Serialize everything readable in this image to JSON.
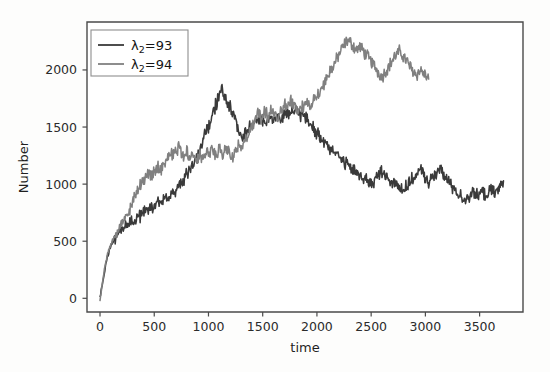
{
  "chart_data": {
    "type": "line",
    "title": "",
    "xlabel": "time",
    "ylabel": "Number",
    "xlim": [
      -120,
      3900
    ],
    "ylim": [
      -120,
      2420
    ],
    "xticks": [
      0,
      500,
      1000,
      1500,
      2000,
      2500,
      3000,
      3500
    ],
    "xtick_labels": [
      "0",
      "500",
      "1000",
      "1500",
      "2000",
      "2500",
      "3000",
      "3500"
    ],
    "yticks": [
      0,
      500,
      1000,
      1500,
      2000
    ],
    "ytick_labels": [
      "0",
      "500",
      "1000",
      "1500",
      "2000"
    ],
    "grid": false,
    "legend_position": "upper left",
    "series": [
      {
        "name": "lambda2_93",
        "legend_label": "λ₂=93",
        "legend_symbol": "λ",
        "legend_sub": "2",
        "legend_rest": "=93",
        "color": "#3a3a3a",
        "x": [
          0,
          20,
          40,
          60,
          80,
          100,
          120,
          140,
          160,
          180,
          200,
          230,
          260,
          290,
          320,
          350,
          380,
          410,
          440,
          470,
          500,
          530,
          560,
          590,
          620,
          650,
          680,
          710,
          740,
          770,
          800,
          830,
          860,
          890,
          920,
          950,
          980,
          1010,
          1040,
          1070,
          1100,
          1130,
          1160,
          1190,
          1220,
          1250,
          1280,
          1310,
          1340,
          1370,
          1400,
          1430,
          1460,
          1490,
          1520,
          1550,
          1580,
          1610,
          1640,
          1670,
          1700,
          1730,
          1760,
          1790,
          1820,
          1850,
          1880,
          1910,
          1940,
          1970,
          2000,
          2040,
          2080,
          2120,
          2160,
          2200,
          2240,
          2280,
          2320,
          2360,
          2400,
          2440,
          2480,
          2520,
          2560,
          2600,
          2640,
          2680,
          2720,
          2760,
          2800,
          2840,
          2880,
          2920,
          2960,
          3000,
          3040,
          3080,
          3120,
          3160,
          3200,
          3240,
          3280,
          3320,
          3360,
          3400,
          3440,
          3480,
          3520,
          3560,
          3600,
          3640,
          3680,
          3720
        ],
        "y": [
          0,
          120,
          230,
          330,
          400,
          460,
          500,
          540,
          570,
          600,
          620,
          660,
          640,
          700,
          680,
          740,
          720,
          780,
          760,
          820,
          800,
          850,
          820,
          880,
          860,
          930,
          900,
          960,
          1000,
          1040,
          1080,
          1130,
          1180,
          1230,
          1300,
          1380,
          1450,
          1520,
          1620,
          1700,
          1790,
          1830,
          1760,
          1700,
          1620,
          1560,
          1470,
          1420,
          1440,
          1490,
          1520,
          1560,
          1540,
          1580,
          1530,
          1570,
          1610,
          1560,
          1600,
          1570,
          1620,
          1590,
          1650,
          1620,
          1660,
          1610,
          1590,
          1560,
          1520,
          1490,
          1440,
          1400,
          1370,
          1320,
          1290,
          1240,
          1200,
          1170,
          1130,
          1100,
          1080,
          1050,
          1020,
          1000,
          1070,
          1120,
          1060,
          1010,
          1030,
          980,
          950,
          990,
          1040,
          1080,
          1120,
          1060,
          1010,
          1080,
          1130,
          1090,
          1040,
          990,
          940,
          900,
          870,
          900,
          930,
          890,
          930,
          900,
          940,
          920,
          960,
          1030
        ],
        "start_value": 0,
        "peak_value": 1830,
        "peak_time": 1130,
        "end_value": 1030,
        "end_time": 3720
      },
      {
        "name": "lambda2_94",
        "legend_label": "λ₂=94",
        "legend_symbol": "λ",
        "legend_sub": "2",
        "legend_rest": "=94",
        "color": "#808080",
        "x": [
          0,
          20,
          40,
          60,
          80,
          100,
          120,
          140,
          160,
          180,
          200,
          230,
          260,
          290,
          320,
          350,
          380,
          410,
          440,
          470,
          500,
          530,
          560,
          590,
          620,
          650,
          680,
          710,
          740,
          770,
          800,
          830,
          860,
          890,
          920,
          950,
          980,
          1010,
          1040,
          1070,
          1100,
          1130,
          1160,
          1190,
          1220,
          1250,
          1280,
          1310,
          1340,
          1370,
          1400,
          1430,
          1460,
          1490,
          1520,
          1550,
          1580,
          1610,
          1640,
          1670,
          1700,
          1730,
          1760,
          1790,
          1820,
          1850,
          1880,
          1910,
          1940,
          1970,
          2000,
          2040,
          2080,
          2120,
          2160,
          2200,
          2240,
          2280,
          2320,
          2360,
          2400,
          2440,
          2480,
          2520,
          2560,
          2600,
          2640,
          2680,
          2720,
          2760,
          2800,
          2840,
          2880,
          2920,
          2960,
          3000,
          3030
        ],
        "y": [
          0,
          130,
          250,
          350,
          420,
          480,
          520,
          560,
          590,
          630,
          660,
          710,
          760,
          820,
          880,
          940,
          1000,
          1060,
          1100,
          1060,
          1110,
          1160,
          1120,
          1180,
          1230,
          1290,
          1260,
          1320,
          1290,
          1250,
          1290,
          1240,
          1280,
          1230,
          1270,
          1230,
          1280,
          1250,
          1300,
          1260,
          1310,
          1270,
          1320,
          1280,
          1240,
          1290,
          1340,
          1300,
          1370,
          1430,
          1490,
          1560,
          1620,
          1580,
          1640,
          1600,
          1660,
          1620,
          1580,
          1640,
          1700,
          1660,
          1720,
          1690,
          1650,
          1700,
          1660,
          1720,
          1680,
          1740,
          1780,
          1840,
          1910,
          1980,
          2050,
          2130,
          2200,
          2260,
          2230,
          2180,
          2200,
          2150,
          2100,
          2050,
          1990,
          1940,
          2000,
          2060,
          2120,
          2160,
          2120,
          2060,
          2000,
          1960,
          2000,
          1950,
          1920
        ],
        "start_value": 0,
        "peak_value": 2260,
        "peak_time": 2240,
        "end_value": 1920,
        "end_time": 3030
      }
    ]
  },
  "axes": {
    "ylabel": "Number",
    "xlabel": "time"
  }
}
